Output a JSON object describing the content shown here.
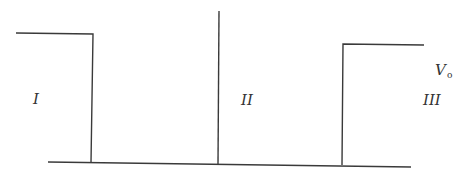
{
  "diagram": {
    "type": "potential-barrier",
    "regions": [
      {
        "id": "region-1",
        "label": "I"
      },
      {
        "id": "region-2",
        "label": "II"
      },
      {
        "id": "region-3",
        "label": "III"
      }
    ],
    "potential_label": {
      "main": "V",
      "subscript": "o"
    },
    "colors": {
      "line": "#3a3a3a",
      "text": "#333333",
      "background": "#ffffff"
    }
  }
}
